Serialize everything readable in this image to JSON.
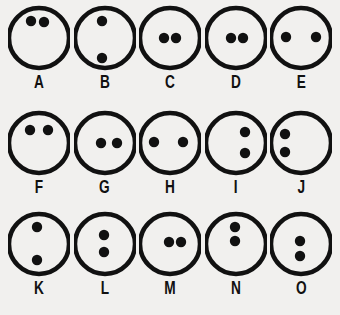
{
  "figure": {
    "name": "two-dot-circle-configurations",
    "background_color": "#f1f0ee",
    "stroke_color": "#111111",
    "dot_color": "#111111",
    "rows": 3,
    "columns": 5,
    "circle_radius": 30,
    "circle_stroke_width": 4.5,
    "dot_radius": 5.2
  },
  "items": [
    {
      "label": "A",
      "dot_count": 2,
      "arrangement": "horizontal-pair-upper-left",
      "dots": [
        {
          "x": 23,
          "y": 19
        },
        {
          "x": 36,
          "y": 20
        }
      ]
    },
    {
      "label": "B",
      "dot_count": 2,
      "arrangement": "vertical-pair-far-apart-left-of-center",
      "dots": [
        {
          "x": 28,
          "y": 19
        },
        {
          "x": 28,
          "y": 56
        }
      ]
    },
    {
      "label": "C",
      "dot_count": 2,
      "arrangement": "horizontal-pair-touching-center",
      "dots": [
        {
          "x": 25,
          "y": 36
        },
        {
          "x": 37,
          "y": 36
        }
      ]
    },
    {
      "label": "D",
      "dot_count": 2,
      "arrangement": "horizontal-pair-touching-center",
      "dots": [
        {
          "x": 26,
          "y": 36
        },
        {
          "x": 38,
          "y": 36
        }
      ]
    },
    {
      "label": "E",
      "dot_count": 2,
      "arrangement": "horizontal-pair-wide-near-edges",
      "dots": [
        {
          "x": 16,
          "y": 35
        },
        {
          "x": 46,
          "y": 35
        }
      ]
    },
    {
      "label": "F",
      "dot_count": 2,
      "arrangement": "horizontal-pair-upper-medium-gap",
      "dots": [
        {
          "x": 22,
          "y": 23
        },
        {
          "x": 40,
          "y": 23
        }
      ]
    },
    {
      "label": "G",
      "dot_count": 2,
      "arrangement": "horizontal-pair-center-to-right-edge",
      "dots": [
        {
          "x": 27,
          "y": 36
        },
        {
          "x": 43,
          "y": 36
        }
      ]
    },
    {
      "label": "H",
      "dot_count": 2,
      "arrangement": "horizontal-pair-wide-near-edges",
      "dots": [
        {
          "x": 15,
          "y": 35
        },
        {
          "x": 44,
          "y": 35
        }
      ]
    },
    {
      "label": "I",
      "dot_count": 2,
      "arrangement": "vertical-pair-right-side",
      "dots": [
        {
          "x": 40,
          "y": 25
        },
        {
          "x": 40,
          "y": 46
        }
      ]
    },
    {
      "label": "J",
      "dot_count": 2,
      "arrangement": "vertical-pair-left-edge",
      "dots": [
        {
          "x": 15,
          "y": 27
        },
        {
          "x": 15,
          "y": 45
        }
      ]
    },
    {
      "label": "K",
      "dot_count": 2,
      "arrangement": "vertical-pair-far-apart-center",
      "dots": [
        {
          "x": 29,
          "y": 19
        },
        {
          "x": 29,
          "y": 52
        }
      ]
    },
    {
      "label": "L",
      "dot_count": 2,
      "arrangement": "vertical-pair-close-center",
      "dots": [
        {
          "x": 30,
          "y": 27
        },
        {
          "x": 30,
          "y": 44
        }
      ]
    },
    {
      "label": "M",
      "dot_count": 2,
      "arrangement": "horizontal-pair-touching-right-of-center",
      "dots": [
        {
          "x": 30,
          "y": 34
        },
        {
          "x": 42,
          "y": 34
        }
      ]
    },
    {
      "label": "N",
      "dot_count": 2,
      "arrangement": "vertical-pair-close-upper-center",
      "dots": [
        {
          "x": 30,
          "y": 19
        },
        {
          "x": 30,
          "y": 33
        }
      ]
    },
    {
      "label": "O",
      "dot_count": 2,
      "arrangement": "vertical-pair-close-center",
      "dots": [
        {
          "x": 30,
          "y": 33
        },
        {
          "x": 30,
          "y": 48
        }
      ]
    }
  ]
}
